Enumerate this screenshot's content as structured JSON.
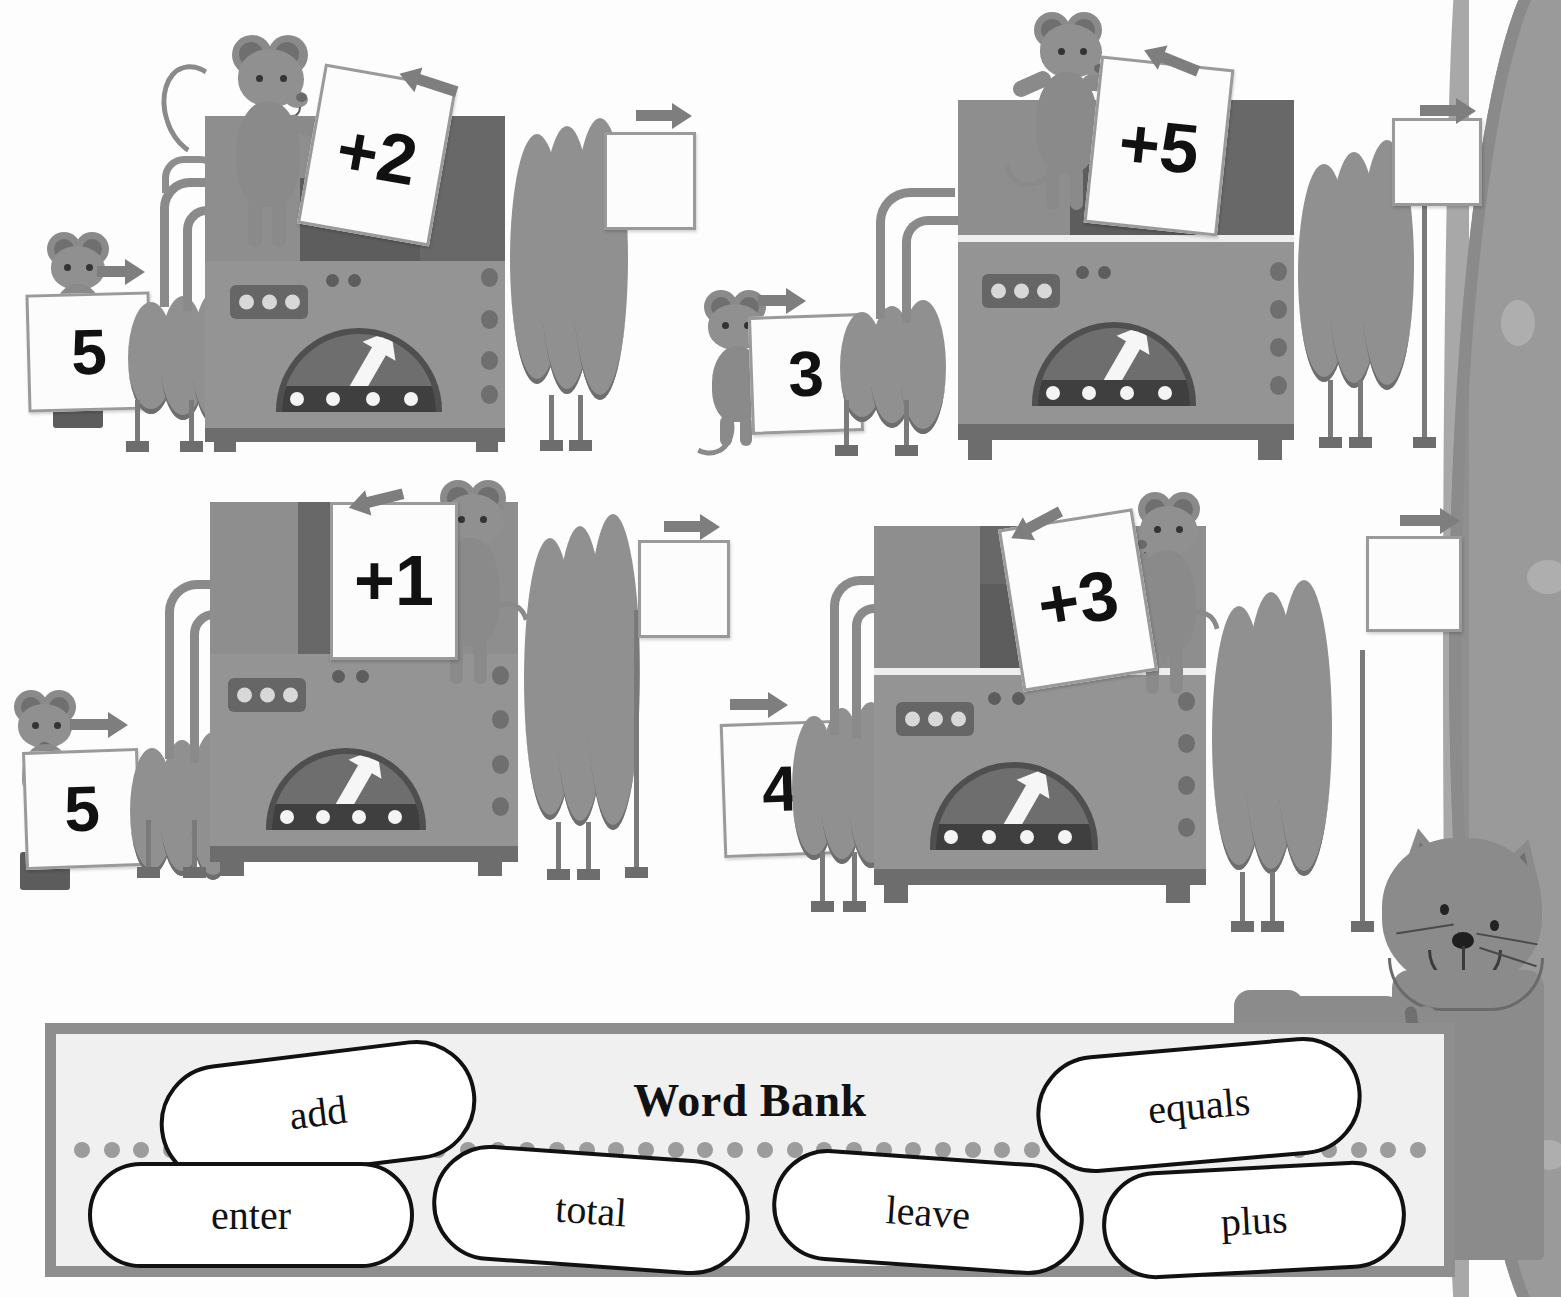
{
  "page": {
    "type": "math-worksheet",
    "theme": "function-machines",
    "background_color": "#fdfdfd"
  },
  "machines": [
    {
      "id": "machine-1",
      "position": "top-left",
      "input_card": "5",
      "operation_card": "+2",
      "output_card": "",
      "input_arrow": "arrow-right",
      "operation_arrow": "arrow-left",
      "output_arrow": "arrow-right",
      "mice": 2
    },
    {
      "id": "machine-2",
      "position": "top-right",
      "input_card": "3",
      "operation_card": "+5",
      "output_card": "",
      "input_arrow": "arrow-right",
      "operation_arrow": "arrow-left",
      "output_arrow": "arrow-right",
      "mice": 2
    },
    {
      "id": "machine-3",
      "position": "bottom-left",
      "input_card": "5",
      "operation_card": "+1",
      "output_card": "",
      "input_arrow": "arrow-right",
      "operation_arrow": "arrow-left",
      "output_arrow": "arrow-right",
      "mice": 2
    },
    {
      "id": "machine-4",
      "position": "bottom-right",
      "input_card": "4",
      "operation_card": "+3",
      "output_card": "",
      "input_arrow": "arrow-right",
      "operation_arrow": "arrow-left",
      "output_arrow": "arrow-right",
      "mice": 2
    }
  ],
  "word_bank": {
    "title": "Word Bank",
    "border_color": "#8e8e8e",
    "fill_color": "#f0f0f0",
    "dot_color": "#9c9c9c",
    "words": [
      {
        "label": "add",
        "row": "top",
        "rotation": -7
      },
      {
        "label": "equals",
        "row": "top",
        "rotation": -5
      },
      {
        "label": "enter",
        "row": "bottom",
        "rotation": 0
      },
      {
        "label": "total",
        "row": "bottom",
        "rotation": 4
      },
      {
        "label": "leave",
        "row": "bottom",
        "rotation": 4
      },
      {
        "label": "plus",
        "row": "bottom",
        "rotation": -3
      }
    ],
    "dot_count": 46
  },
  "cat": {
    "label": "cat-character",
    "position": "bottom-right",
    "color": "#8b8b8b"
  },
  "decor": {
    "tree_trunk": {
      "label": "tree-trunk",
      "color": "#9a9a9a",
      "edge": "right"
    }
  },
  "colors": {
    "machine_body": "#8e8e8e",
    "machine_lower": "#949494",
    "machine_dark": "#686868",
    "hose": "#909090",
    "card_fill": "#fcfcfc",
    "card_border": "#9a9a9a",
    "arrow": "#7e7e7e",
    "mouse": "#8a8a8a",
    "ink": "#111111"
  }
}
